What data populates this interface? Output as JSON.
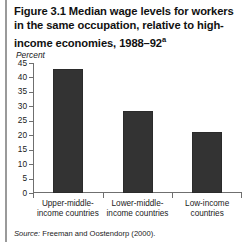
{
  "figure": {
    "number": "Figure 3.1",
    "title_text": "Figure 3.1  Median wage levels for workers in the same occupation, relative to high-income economies, 1988–92",
    "title_superscript": "a",
    "source": "Source: Freeman and Oostendorp (2000).",
    "source_label": "Source:",
    "source_rest": " Freeman and Oostendorp (2000)."
  },
  "chart_data": {
    "type": "bar",
    "title": "Figure 3.1  Median wage levels for workers in the same occupation, relative to high-income economies, 1988–92",
    "categories": [
      "Upper-middle-\nincome countries",
      "Lower-middle-\nincome countries",
      "Low-income\ncountries"
    ],
    "values": [
      43,
      28.5,
      21
    ],
    "xlabel": "",
    "ylabel": "Percent",
    "ylim": [
      0,
      45
    ],
    "yticks": [
      0,
      5,
      10,
      15,
      20,
      25,
      30,
      35,
      40,
      45
    ],
    "ytick_labels": [
      "0",
      "5",
      "10",
      "15",
      "20",
      "25",
      "30",
      "35",
      "40",
      "45"
    ],
    "grid": false,
    "legend": false,
    "bar_color": "#333333"
  },
  "colors": {
    "bar": "#333333",
    "axis": "#6f6f6f",
    "rule": "#9a9a9a",
    "text": "#1a1a1a",
    "background": "#ffffff"
  }
}
